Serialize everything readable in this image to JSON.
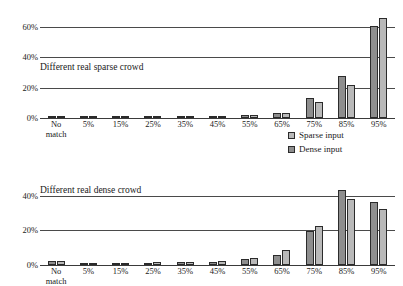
{
  "chart_data": [
    {
      "type": "bar",
      "title": "Different real sparse crowd",
      "xlabel": "",
      "ylabel": "",
      "ylim": [
        0,
        70
      ],
      "yticks": [
        "0%",
        "20%",
        "40%",
        "60%"
      ],
      "ytick_values": [
        0,
        20,
        40,
        60
      ],
      "grid": true,
      "legend_position": "below-right",
      "categories": [
        "No\nmatch",
        "5%",
        "15%",
        "25%",
        "35%",
        "45%",
        "55%",
        "65%",
        "75%",
        "85%",
        "95%"
      ],
      "series": [
        {
          "name": "Dense input",
          "color": "#8e8e8e",
          "values": [
            1.0,
            1.0,
            1.0,
            1.0,
            1.0,
            1.2,
            1.8,
            3.5,
            13.0,
            28.0,
            61.0
          ]
        },
        {
          "name": "Sparse input",
          "color": "#b9b9b9",
          "values": [
            1.0,
            1.0,
            1.0,
            1.0,
            1.2,
            1.5,
            2.0,
            3.5,
            10.5,
            22.0,
            66.0
          ]
        }
      ]
    },
    {
      "type": "bar",
      "title": "Different real dense crowd",
      "xlabel": "",
      "ylabel": "",
      "ylim": [
        0,
        45
      ],
      "yticks": [
        "0%",
        "20%",
        "40%"
      ],
      "ytick_values": [
        0,
        20,
        40
      ],
      "grid": true,
      "legend_position": "above-right",
      "categories": [
        "No\nmatch",
        "5%",
        "15%",
        "25%",
        "35%",
        "45%",
        "55%",
        "65%",
        "75%",
        "85%",
        "95%"
      ],
      "series": [
        {
          "name": "Dense input",
          "color": "#8e8e8e",
          "values": [
            2.5,
            1.0,
            1.0,
            1.2,
            1.5,
            2.0,
            3.5,
            5.5,
            19.5,
            43.0,
            36.5
          ]
        },
        {
          "name": "Sparse input",
          "color": "#b9b9b9",
          "values": [
            2.5,
            1.2,
            1.0,
            1.5,
            1.8,
            2.5,
            3.8,
            8.5,
            22.5,
            38.0,
            32.5
          ]
        }
      ]
    }
  ],
  "legend": {
    "items": [
      {
        "label": "Sparse input",
        "color": "#b9b9b9"
      },
      {
        "label": "Dense input",
        "color": "#8e8e8e"
      }
    ]
  }
}
